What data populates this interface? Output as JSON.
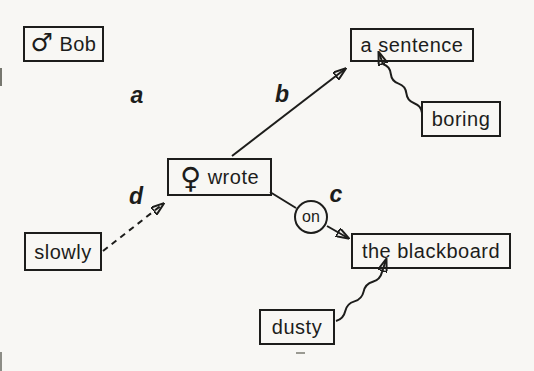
{
  "canvas": {
    "background": "#f8f7f4",
    "ink": "#1d1d1b"
  },
  "nodes": {
    "bob": {
      "symbol": "♂",
      "label": "Bob"
    },
    "sentence": {
      "label": "a sentence"
    },
    "boring": {
      "label": "boring"
    },
    "wrote": {
      "symbol": "♀",
      "label": "wrote"
    },
    "slowly": {
      "label": "slowly"
    },
    "blackboard": {
      "label": "the blackboard"
    },
    "dusty": {
      "label": "dusty"
    },
    "on": {
      "label": "on"
    }
  },
  "edge_labels": {
    "a": "a",
    "b": "b",
    "c": "c",
    "d": "d"
  }
}
